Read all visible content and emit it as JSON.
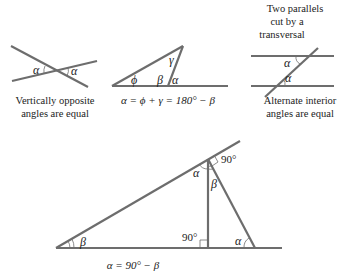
{
  "figure1": {
    "angle_left": "α",
    "angle_right": "α",
    "caption_line1": "Vertically opposite",
    "caption_line2": "angles are equal"
  },
  "figure2": {
    "angle_phi": "ϕ",
    "angle_gamma": "γ",
    "angle_beta": "β",
    "angle_alpha": "α",
    "equation": "α = ϕ + γ = 180° − β"
  },
  "figure3": {
    "title_line1": "Two parallels",
    "title_line2": "cut by a",
    "title_line3": "transversal",
    "angle_top": "α",
    "angle_bottom": "α",
    "caption_line1": "Alternate interior",
    "caption_line2": "angles are equal"
  },
  "figure4": {
    "angle_beta_left": "β",
    "angle_alpha_top": "α",
    "angle_beta_top": "β",
    "label_90_top": "90°",
    "label_90_bottom": "90°",
    "angle_alpha_right": "α",
    "equation": "α = 90° − β"
  },
  "colors": {
    "line": "#6d6d6d",
    "text": "#222222",
    "background": "#ffffff"
  }
}
